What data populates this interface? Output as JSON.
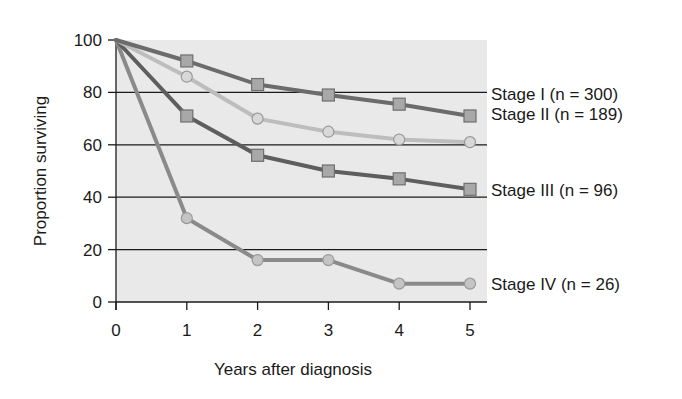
{
  "chart_data": {
    "type": "line",
    "title": "",
    "xlabel": "Years after diagnosis",
    "ylabel": "Proportion surviving",
    "x": [
      0,
      1,
      2,
      3,
      4,
      5
    ],
    "xticks": [
      "0",
      "1",
      "2",
      "3",
      "4",
      "5"
    ],
    "yticks": [
      "0",
      "20",
      "40",
      "60",
      "80",
      "100"
    ],
    "xlim": [
      0,
      5
    ],
    "ylim": [
      0,
      100
    ],
    "grid": "horizontal",
    "legend_position": "right, inline at line ends",
    "series": [
      {
        "name": "Stage I (n = 300)",
        "values": [
          100,
          92,
          83,
          79,
          75.5,
          71
        ],
        "marker": "square",
        "color": "#6b6b6b",
        "marker_fill": "#a8a8a8"
      },
      {
        "name": "Stage II (n = 189)",
        "values": [
          100,
          86,
          70,
          65,
          62,
          61
        ],
        "marker": "circle",
        "color": "#bdbdbd",
        "marker_fill": "#d8d8d8"
      },
      {
        "name": "Stage III (n = 96)",
        "values": [
          100,
          71,
          56,
          50,
          47,
          43
        ],
        "marker": "square",
        "color": "#5e5e5e",
        "marker_fill": "#a8a8a8"
      },
      {
        "name": "Stage IV (n = 26)",
        "values": [
          100,
          32,
          16,
          16,
          7,
          7
        ],
        "marker": "circle",
        "color": "#8a8a8a",
        "marker_fill": "#c4c4c4"
      }
    ]
  },
  "colors": {
    "plot_background": "#e9e9e9",
    "gridline": "#1a1a1a",
    "axis": "#1a1a1a"
  }
}
